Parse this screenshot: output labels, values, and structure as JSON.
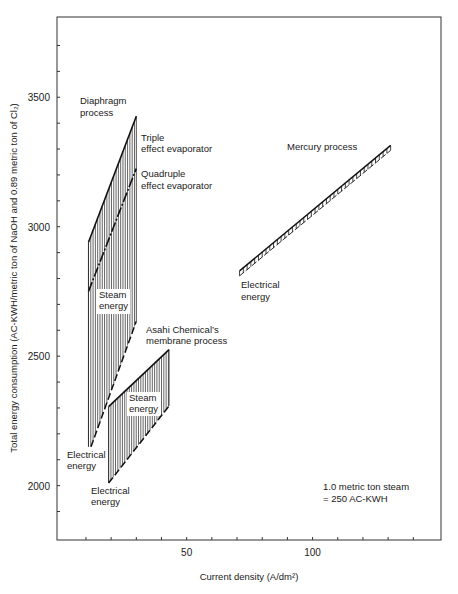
{
  "chart_data": {
    "type": "line",
    "title": "",
    "xlabel": "Current density (A/dm²)",
    "ylabel": "Total energy consumption (AC-KWH/metric ton of NaOH and 0.89 metric ton of Cl₂)",
    "xlim": [
      -1.5,
      151
    ],
    "ylim": [
      1790,
      3810
    ],
    "x_ticks": [
      10,
      20,
      30,
      40,
      50,
      60,
      70,
      80,
      90,
      100,
      110,
      120,
      130,
      140
    ],
    "x_tick_labels": [
      {
        "value": 50,
        "label": "50"
      },
      {
        "value": 100,
        "label": "100"
      }
    ],
    "y_ticks": [
      1900,
      2000,
      2100,
      2200,
      2300,
      2400,
      2500,
      2600,
      2700,
      2800,
      2900,
      3000,
      3100,
      3200,
      3300,
      3400,
      3500,
      3600,
      3700
    ],
    "y_tick_labels": [
      {
        "value": 2000,
        "label": "2000"
      },
      {
        "value": 2500,
        "label": "2500"
      },
      {
        "value": 3000,
        "label": "3000"
      },
      {
        "value": 3500,
        "label": "3500"
      }
    ],
    "grid": false,
    "series": [
      {
        "name": "Diaphragm process - Triple effect evaporator (total)",
        "style": "solid",
        "x": [
          11,
          30
        ],
        "y": [
          2940,
          3427
        ]
      },
      {
        "name": "Diaphragm process - Quadruple effect evaporator (total)",
        "style": "dash-dot",
        "x": [
          11,
          30
        ],
        "y": [
          2750,
          3225
        ]
      },
      {
        "name": "Diaphragm process - Electrical energy",
        "style": "dashed",
        "x": [
          12,
          30
        ],
        "y": [
          2150,
          2635
        ]
      },
      {
        "name": "Asahi Chemical's membrane process (total)",
        "style": "solid",
        "x": [
          19,
          43
        ],
        "y": [
          2305,
          2525
        ]
      },
      {
        "name": "Asahi Chemical's membrane process - Electrical energy",
        "style": "dashed",
        "x": [
          19,
          43
        ],
        "y": [
          2010,
          2308
        ]
      },
      {
        "name": "Mercury process",
        "style": "hatched-band",
        "x": [
          71,
          131
        ],
        "y": [
          2810,
          3295
        ]
      }
    ],
    "annotations": {
      "diaphragm": "Diaphragm process",
      "triple": [
        "Triple",
        "effect evaporator"
      ],
      "quadruple": [
        "Quadruple",
        "effect evaporator"
      ],
      "steam1": [
        "Steam",
        "energy"
      ],
      "elec1": [
        "Electrical",
        "energy"
      ],
      "asahi": [
        "Asahi Chemical’s",
        "membrane process"
      ],
      "steam2": [
        "Steam",
        "energy"
      ],
      "elec2": [
        "Electrical",
        "energy"
      ],
      "mercury": "Mercury process",
      "elec3": [
        "Electrical",
        "energy"
      ],
      "note": [
        "1.0 metric ton steam",
        "= 250 AC-KWH"
      ]
    }
  }
}
